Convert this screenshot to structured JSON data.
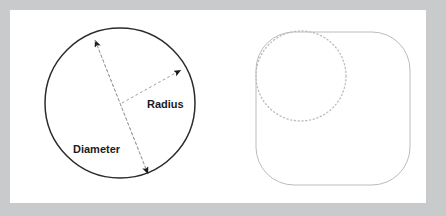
{
  "figure": {
    "background_color": "#c9cacb",
    "panel_color": "#ffffff",
    "labels": {
      "radius": "Radius",
      "diameter": "Diameter"
    },
    "left_shape": {
      "name": "circle",
      "stroke_color": "#2b2b2b",
      "center_x": 120,
      "center_y": 103,
      "radius": 75
    },
    "right_shape": {
      "name": "rounded-square",
      "stroke_color": "#b9bcc0",
      "x": 256,
      "y": 32,
      "width": 154,
      "height": 153,
      "corner_radius": 38
    },
    "inscribed_circle": {
      "name": "dotted-circle",
      "stroke_color": "#b9bcc0",
      "center_x": 301,
      "center_y": 76,
      "radius": 45,
      "style": "dotted"
    },
    "diameter_line": {
      "stroke_color": "#9a9a9a",
      "style": "dashed",
      "x1": 95,
      "y1": 40,
      "x2": 148,
      "y2": 174,
      "arrowheads": "both"
    },
    "radius_line": {
      "stroke_color": "#9a9a9a",
      "style": "dashed",
      "x1": 122,
      "y1": 103,
      "x2": 181,
      "y2": 70,
      "arrowheads": "end"
    }
  }
}
